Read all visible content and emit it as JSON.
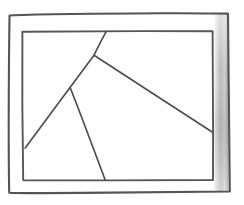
{
  "canvas": {
    "width": 244,
    "height": 205,
    "background_color": "#ffffff",
    "title": "hand-drawn rectangle divided by three straight lines"
  },
  "palette": {
    "ink": "#4e4f53",
    "frame_ink": "#555558",
    "shade_light": "#cfcfcf",
    "shade_mid": "#a9a9ab",
    "paper": "#ffffff"
  },
  "shapes": {
    "outer_frame": {
      "label": "outer border rectangle",
      "points": "9,14 228,13 230,192 9,193",
      "stroke": "#555558",
      "stroke_width": 2.1
    },
    "inner_frame": {
      "label": "inner rectangle",
      "points": "22,31 213,31 213,180 23,180",
      "stroke": "#55565a",
      "stroke_width": 1.9
    },
    "right_shade_band": {
      "label": "shaded right border band",
      "x": 214,
      "y": 14,
      "width": 15,
      "height": 178,
      "fill_from": "#d8d8d8",
      "fill_to": "#9f9fa1"
    }
  },
  "partitions": [
    {
      "name": "steep-line-top",
      "label": "line from top edge down to central junction",
      "x1": 106,
      "y1": 31,
      "x2": 94,
      "y2": 55
    },
    {
      "name": "long-diagonal-left",
      "label": "line from central junction down-left to left edge",
      "x1": 94,
      "y1": 55,
      "x2": 25,
      "y2": 148
    },
    {
      "name": "long-diagonal-right",
      "label": "line from central junction down-right to right edge",
      "x1": 94,
      "y1": 55,
      "x2": 212,
      "y2": 132
    },
    {
      "name": "fork-line-bottom",
      "label": "line from mid-left fork down to bottom edge",
      "x1": 70,
      "y1": 87,
      "x2": 105,
      "y2": 180
    }
  ],
  "junctions": [
    {
      "name": "central-junction",
      "x": 94,
      "y": 55
    },
    {
      "name": "lower-fork-junction",
      "x": 70,
      "y": 87
    }
  ],
  "regions_count": 4
}
